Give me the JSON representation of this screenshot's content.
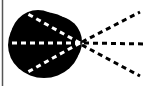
{
  "diagram": {
    "colors": {
      "background": "#ffffff",
      "blob": "#000000",
      "ray_inside": "#ffffff",
      "ray_outside": "#000000",
      "border": "#555555"
    },
    "focal_point": {
      "x": 80,
      "y": 43
    },
    "rays": [
      {
        "name": "upper",
        "inner_end": {
          "x": 26,
          "y": 13
        },
        "outer_end": {
          "x": 140,
          "y": 12
        }
      },
      {
        "name": "middle",
        "inner_end": {
          "x": 8,
          "y": 43
        },
        "outer_end": {
          "x": 146,
          "y": 44
        }
      },
      {
        "name": "lower",
        "inner_end": {
          "x": 26,
          "y": 73
        },
        "outer_end": {
          "x": 140,
          "y": 76
        }
      }
    ]
  }
}
